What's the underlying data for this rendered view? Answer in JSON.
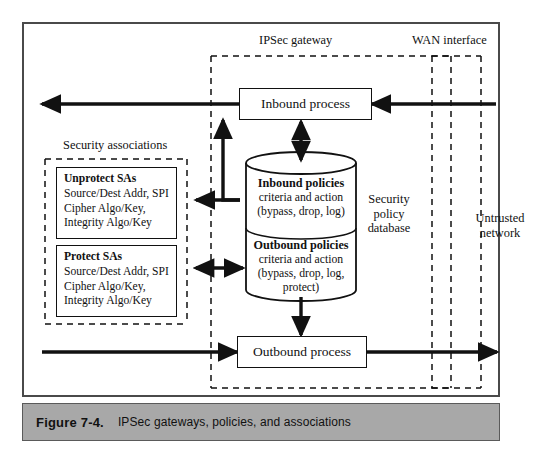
{
  "figure": {
    "number": "Figure 7-4.",
    "title": "IPSec gateways, policies, and associations"
  },
  "zones": {
    "ipsec_gateway": "IPSec gateway",
    "wan_interface": "WAN interface",
    "security_associations": "Security associations",
    "untrusted_network": "Untrusted\nnetwork",
    "untrusted_network_line1": "Untrusted",
    "untrusted_network_line2": "network",
    "security_policy_database_line1": "Security",
    "security_policy_database_line2": "policy",
    "security_policy_database_line3": "database"
  },
  "processes": {
    "inbound": "Inbound process",
    "outbound": "Outbound process"
  },
  "sa_boxes": [
    {
      "title": "Unprotect SAs",
      "lines": [
        "Source/Dest Addr, SPI",
        "Cipher Algo/Key,",
        "Integrity Algo/Key"
      ]
    },
    {
      "title": "Protect SAs",
      "lines": [
        "Source/Dest Addr, SPI",
        "Cipher Algo/Key,",
        "Integrity Algo/Key"
      ]
    }
  ],
  "policy_db": {
    "inbound": {
      "title": "Inbound policies",
      "lines": [
        "criteria and action",
        "(bypass, drop, log)"
      ]
    },
    "outbound": {
      "title": "Outbound policies",
      "lines": [
        "criteria and action",
        "(bypass, drop, log,",
        "protect)"
      ]
    }
  },
  "colors": {
    "frame_border": "#4a4a4a",
    "caption_bg": "#a8a8a8",
    "stroke": "#111111",
    "background": "#ffffff"
  }
}
